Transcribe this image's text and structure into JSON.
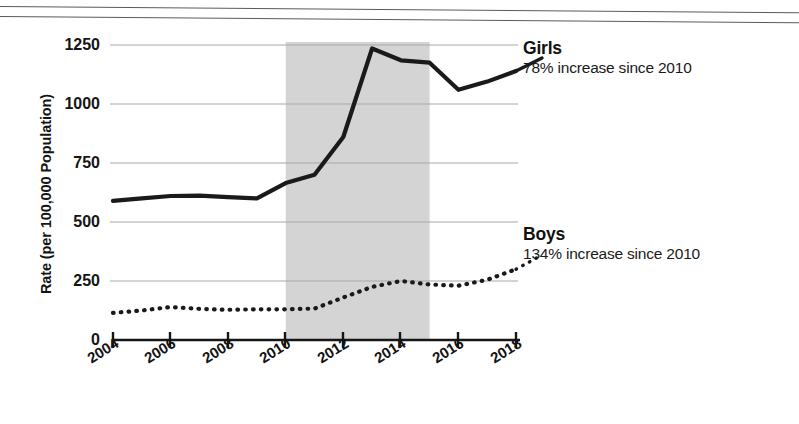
{
  "chart_data": {
    "type": "line",
    "title": "",
    "xlabel": "",
    "ylabel": "Rate (per 100,000 Population)",
    "xlim": [
      2004,
      2018
    ],
    "ylim": [
      0,
      1250
    ],
    "yticks": [
      0,
      250,
      500,
      750,
      1000,
      1250
    ],
    "ytick_labels": [
      "0",
      "250",
      "500",
      "750",
      "1000",
      "1250"
    ],
    "xticks": [
      2004,
      2006,
      2008,
      2010,
      2012,
      2014,
      2016,
      2018
    ],
    "xtick_labels": [
      "2004",
      "2006",
      "2008",
      "2010",
      "2012",
      "2014",
      "2016",
      "2018"
    ],
    "grid": "horizontal",
    "legend_position": "right-inline-annotation",
    "x": [
      2004,
      2005,
      2006,
      2007,
      2008,
      2009,
      2010,
      2011,
      2012,
      2013,
      2014,
      2015,
      2016,
      2017,
      2018
    ],
    "series": [
      {
        "name": "Girls",
        "style": "solid",
        "color": "#1a1a1a",
        "values": [
          590,
          600,
          610,
          612,
          605,
          600,
          665,
          700,
          860,
          1235,
          1185,
          1175,
          1060,
          1095,
          1140
        ]
      },
      {
        "name": "Boys",
        "style": "dotted",
        "color": "#1a1a1a",
        "values": [
          115,
          125,
          140,
          132,
          128,
          130,
          130,
          133,
          180,
          225,
          250,
          235,
          230,
          255,
          300
        ]
      }
    ],
    "shaded_region": {
      "x_start": 2010,
      "x_end": 2015,
      "color": "#d4d4d4"
    },
    "annotations": [
      {
        "series": "Girls",
        "title": "Girls",
        "subtitle": "78% increase since 2010"
      },
      {
        "series": "Boys",
        "title": "Boys",
        "subtitle": "134% increase since 2010"
      }
    ]
  },
  "axis": {
    "y_label": "Rate (per 100,000 Population)",
    "y_ticks": [
      "1250",
      "1000",
      "750",
      "500",
      "250",
      "0"
    ],
    "x_ticks": [
      "2004",
      "2006",
      "2008",
      "2010",
      "2012",
      "2014",
      "2016",
      "2018"
    ]
  },
  "legend": {
    "girls": {
      "title": "Girls",
      "subtitle": "78% increase since 2010"
    },
    "boys": {
      "title": "Boys",
      "subtitle": "134% increase since 2010"
    }
  }
}
